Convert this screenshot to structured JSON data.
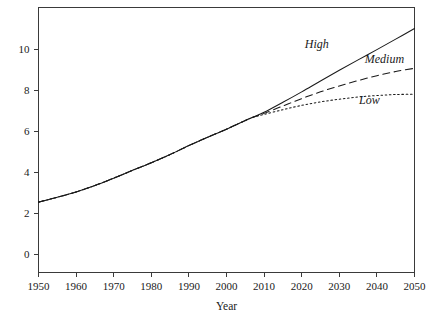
{
  "chart_data": {
    "type": "line",
    "title": "",
    "subtitle": "",
    "xlabel": "Year",
    "ylabel": "",
    "xlim": [
      1948,
      2052
    ],
    "ylim": [
      0,
      11.6
    ],
    "grid": false,
    "legend_position": "inline-annotations",
    "x_ticks": [
      "1950",
      "1960",
      "1970",
      "1980",
      "1990",
      "2000",
      "2010",
      "2020",
      "2030",
      "2040",
      "2050"
    ],
    "x_tick_values": [
      1950,
      1960,
      1970,
      1980,
      1990,
      2000,
      2010,
      2020,
      2030,
      2040,
      2050
    ],
    "y_ticks": [
      "0",
      "2",
      "4",
      "6",
      "8",
      "10"
    ],
    "y_tick_values": [
      0,
      2,
      4,
      6,
      8,
      10
    ],
    "x": [
      1950,
      1955,
      1960,
      1965,
      1970,
      1975,
      1980,
      1985,
      1990,
      1995,
      2000,
      2005,
      2007,
      2010,
      2015,
      2020,
      2025,
      2030,
      2035,
      2040,
      2045,
      2050
    ],
    "series": [
      {
        "name": "High",
        "style": "solid",
        "color": "#1a1a1a",
        "values": [
          2.53,
          2.77,
          3.03,
          3.34,
          3.7,
          4.08,
          4.45,
          4.85,
          5.29,
          5.7,
          6.09,
          6.51,
          6.67,
          6.91,
          7.4,
          7.91,
          8.44,
          8.96,
          9.47,
          9.97,
          10.48,
          11.0
        ]
      },
      {
        "name": "Medium",
        "style": "dashed",
        "color": "#1a1a1a",
        "values": [
          2.53,
          2.77,
          3.03,
          3.34,
          3.7,
          4.08,
          4.45,
          4.85,
          5.29,
          5.7,
          6.09,
          6.51,
          6.67,
          6.86,
          7.22,
          7.58,
          7.91,
          8.2,
          8.46,
          8.7,
          8.9,
          9.06
        ]
      },
      {
        "name": "Low",
        "style": "dotted",
        "color": "#1a1a1a",
        "values": [
          2.53,
          2.77,
          3.03,
          3.34,
          3.7,
          4.08,
          4.45,
          4.85,
          5.29,
          5.7,
          6.09,
          6.51,
          6.67,
          6.81,
          7.04,
          7.25,
          7.42,
          7.55,
          7.66,
          7.73,
          7.78,
          7.79
        ]
      }
    ],
    "annotations": [
      {
        "text": "High",
        "x": 2024,
        "y": 10.05
      },
      {
        "text": "Medium",
        "x": 2042,
        "y": 9.3
      },
      {
        "text": "Low",
        "x": 2038,
        "y": 7.3
      }
    ]
  }
}
